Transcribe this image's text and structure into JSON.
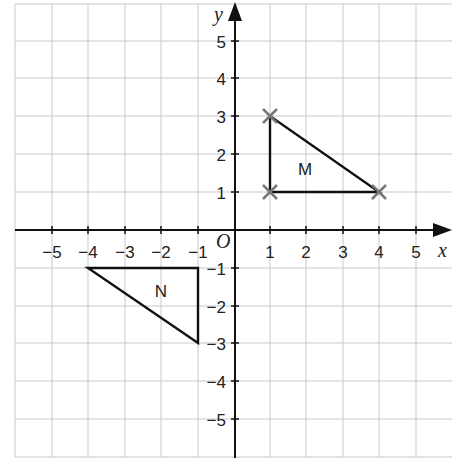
{
  "diagram": {
    "type": "coordinate-grid",
    "axes": {
      "x_label": "x",
      "y_label": "y",
      "origin_label": "O",
      "x_range": [
        -5,
        5
      ],
      "y_range": [
        -5,
        5
      ]
    },
    "x_ticks": [
      "−5",
      "−4",
      "−3",
      "−2",
      "−1",
      "1",
      "2",
      "3",
      "4",
      "5"
    ],
    "y_ticks_pos": [
      "5",
      "4",
      "3",
      "2",
      "1"
    ],
    "y_ticks_neg": [
      "−1",
      "−2",
      "−3",
      "−4",
      "−5"
    ],
    "shapes": [
      {
        "name": "M",
        "label": "M",
        "vertices": [
          [
            1,
            3
          ],
          [
            1,
            1
          ],
          [
            4,
            1
          ]
        ],
        "marked_vertices": true
      },
      {
        "name": "N",
        "label": "N",
        "vertices": [
          [
            -4,
            -1
          ],
          [
            -1,
            -1
          ],
          [
            -1,
            -3
          ]
        ],
        "marked_vertices": false
      }
    ],
    "colors": {
      "grid": "#c9c9c9",
      "axis": "#111111",
      "cross": "#777777"
    }
  }
}
